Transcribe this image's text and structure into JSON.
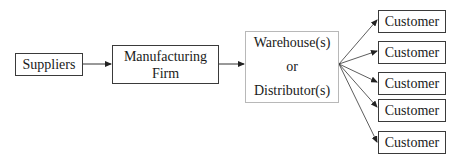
{
  "diagram": {
    "type": "supply-chain-flow",
    "nodes": {
      "suppliers": "Suppliers",
      "manufacturer": {
        "line1": "Manufacturing",
        "line2": "Firm"
      },
      "warehouse": {
        "line1": "Warehouse(s)",
        "line2": "or",
        "line3": "Distributor(s)"
      },
      "customers": [
        "Customer",
        "Customer",
        "Customer",
        "Customer",
        "Customer"
      ]
    },
    "edges": [
      {
        "from": "suppliers",
        "to": "manufacturer"
      },
      {
        "from": "manufacturer",
        "to": "warehouse"
      },
      {
        "from": "warehouse",
        "to": "customer-1"
      },
      {
        "from": "warehouse",
        "to": "customer-2"
      },
      {
        "from": "warehouse",
        "to": "customer-3"
      },
      {
        "from": "warehouse",
        "to": "customer-4"
      },
      {
        "from": "warehouse",
        "to": "customer-5"
      }
    ]
  }
}
